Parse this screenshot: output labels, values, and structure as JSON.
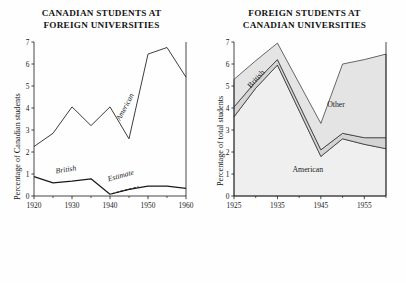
{
  "figure": {
    "background": "#fefefe",
    "ink": "#1a1a1a"
  },
  "panels": [
    {
      "id": "canadian-students-abroad",
      "title_line1": "CANADIAN STUDENTS AT",
      "title_line2": "FOREIGN UNIVERSITIES",
      "ylabel": "Percentage of Canadian students"
    },
    {
      "id": "foreign-students-in-canada",
      "title_line1": "FOREIGN STUDENTS AT",
      "title_line2": "CANADIAN UNIVERSITIES",
      "ylabel": "Percentage of total students"
    }
  ],
  "chart_data": [
    {
      "type": "line",
      "id": "canadian-students-abroad",
      "title": "CANADIAN STUDENTS AT FOREIGN UNIVERSITIES",
      "xlabel": "",
      "ylabel": "Percentage of Canadian students",
      "xlim": [
        1920,
        1960
      ],
      "ylim": [
        0,
        7
      ],
      "xticks": [
        1920,
        1930,
        1940,
        1950,
        1960
      ],
      "xticklabels": [
        "1920",
        "1930",
        "1940",
        "1950",
        "1960"
      ],
      "xminorticks": [
        1925,
        1935,
        1945,
        1955
      ],
      "yticks": [
        0,
        1,
        2,
        3,
        4,
        5,
        6,
        7
      ],
      "yticklabels": [
        "0",
        "1",
        "2",
        "3",
        "4",
        "5",
        "6",
        "7"
      ],
      "grid": false,
      "legend": "inline-annotations",
      "x": [
        1920,
        1925,
        1930,
        1935,
        1940,
        1945,
        1950,
        1955,
        1960
      ],
      "series": [
        {
          "name": "American",
          "style": "solid",
          "values": [
            2.25,
            2.85,
            4.05,
            3.2,
            4.05,
            2.6,
            6.45,
            6.75,
            5.4
          ]
        },
        {
          "name": "British",
          "style": "solid",
          "values": [
            0.88,
            0.6,
            0.68,
            0.78,
            0.08,
            0.3,
            0.45,
            0.45,
            0.35
          ]
        }
      ],
      "annotations": [
        {
          "text": "American",
          "x": 1944.5,
          "y": 4.0,
          "rotation": -62,
          "italic": true
        },
        {
          "text": "British",
          "x": 1928.5,
          "y": 1.1,
          "rotation": -9,
          "italic": true
        },
        {
          "text": "Estimate",
          "x": 1943.0,
          "y": 0.82,
          "rotation": -16,
          "italic": true
        }
      ],
      "estimate_segment": {
        "label": "Estimate",
        "style": "dashed",
        "x": [
          1940.5,
          1942.5,
          1945,
          1947.5
        ],
        "y": [
          0.1,
          0.2,
          0.3,
          0.42
        ]
      }
    },
    {
      "type": "area",
      "id": "foreign-students-in-canada",
      "stacked": true,
      "title": "FOREIGN STUDENTS AT CANADIAN UNIVERSITIES",
      "xlabel": "",
      "ylabel": "Percentage of total students",
      "xlim": [
        1925,
        1960
      ],
      "ylim": [
        0,
        7
      ],
      "xticks": [
        1925,
        1935,
        1945,
        1955
      ],
      "xticklabels": [
        "1925",
        "1935",
        "1945",
        "1955"
      ],
      "xminorticks": [
        1930,
        1940,
        1950,
        1960
      ],
      "yticks": [
        0,
        1,
        2,
        3,
        4,
        5,
        6,
        7
      ],
      "yticklabels": [
        "0",
        "1",
        "2",
        "3",
        "4",
        "5",
        "6",
        "7"
      ],
      "grid": false,
      "legend": "inline-annotations",
      "x": [
        1925,
        1930,
        1935,
        1945,
        1950,
        1955,
        1960
      ],
      "series": [
        {
          "name": "American",
          "fill": "#efefef",
          "values": [
            3.6,
            4.9,
            5.95,
            1.8,
            2.6,
            2.35,
            2.15
          ]
        },
        {
          "name": "British",
          "fill": "#d4d4d4",
          "values": [
            0.45,
            0.3,
            0.25,
            0.3,
            0.25,
            0.3,
            0.5
          ]
        },
        {
          "name": "Other",
          "fill": "#e4e4e4",
          "values": [
            1.25,
            0.95,
            0.75,
            1.2,
            3.15,
            3.55,
            3.8
          ]
        }
      ],
      "totals": [
        5.3,
        6.15,
        6.95,
        3.3,
        6.0,
        6.2,
        6.45
      ],
      "annotations": [
        {
          "text": "British",
          "x": 1930.5,
          "y": 5.25,
          "rotation": -48,
          "italic": false
        },
        {
          "text": "Other",
          "x": 1948.5,
          "y": 4.05,
          "rotation": 0,
          "italic": false
        },
        {
          "text": "American",
          "x": 1942.0,
          "y": 1.1,
          "rotation": 0,
          "italic": false
        }
      ]
    }
  ]
}
